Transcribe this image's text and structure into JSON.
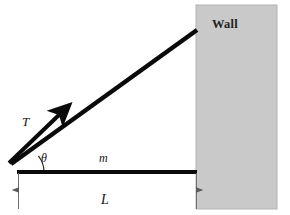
{
  "figure": {
    "type": "free-body-diagram",
    "background_color": "#ffffff"
  },
  "wall": {
    "label": "Wall",
    "fill_color": "#c9c9c9",
    "border_color": "#b4b4b4",
    "x": 196,
    "y": 5,
    "width": 81,
    "height": 204
  },
  "beam": {
    "label": "m",
    "color": "#0a0a0a",
    "thickness": 4,
    "x1": 18,
    "y1": 172,
    "x2": 197,
    "y2": 172
  },
  "cable": {
    "color": "#0a0a0a",
    "thickness": 4.5,
    "x1": 11,
    "y1": 164,
    "x2": 197,
    "y2": 30
  },
  "tension_arrow": {
    "label": "T",
    "color": "#0a0a0a",
    "thickness": 4,
    "x1": 9,
    "y1": 163,
    "x2": 64,
    "y2": 110
  },
  "angle": {
    "label": "θ",
    "vertex_x": 18,
    "vertex_y": 172,
    "radius": 26,
    "color": "#141414"
  },
  "dimension": {
    "label": "L",
    "color": "#4a4a4a",
    "x1": 18,
    "x2": 196,
    "y": 190,
    "extension_top": 172,
    "extension_bottom": 209
  }
}
